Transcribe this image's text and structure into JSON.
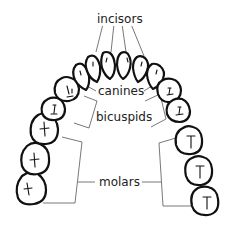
{
  "diagram": {
    "type": "dental arch anatomy",
    "labels": {
      "incisors": "incisors",
      "canines": "canines",
      "bicuspids": "bicuspids",
      "molars": "molars"
    },
    "colors": {
      "outline": "#111111",
      "leader": "#555555",
      "background": "#ffffff"
    }
  }
}
